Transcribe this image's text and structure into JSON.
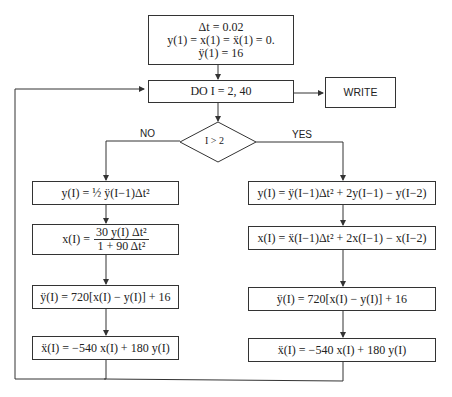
{
  "init": {
    "line1": "Δt = 0.02",
    "line2": "y(1) = x(1) = ẍ(1) = 0.",
    "line3": "ÿ(1) = 16"
  },
  "loop": {
    "label": "DO  I = 2, 40"
  },
  "write": {
    "label": "WRITE"
  },
  "decision": {
    "label": "I > 2",
    "no_label": "NO",
    "yes_label": "YES"
  },
  "no_branch": {
    "step1": "y(I) = ½ ÿ(I−1)Δt²",
    "step2_lhs": "x(I) =",
    "step2_num": "30 y(I) Δt²",
    "step2_den": "1 + 90 Δt²",
    "step3": "ÿ(I) = 720[x(I) − y(I)] + 16",
    "step4": "ẍ(I) = −540 x(I) + 180 y(I)"
  },
  "yes_branch": {
    "step1": "y(I) = ÿ(I−1)Δt² + 2y(I−1) − y(I−2)",
    "step2": "x(I) = ẍ(I−1)Δt² + 2x(I−1) − x(I−2)",
    "step3": "ÿ(I) = 720[x(I) − y(I)] + 16",
    "step4": "ẍ(I) = −540 x(I) + 180 y(I)"
  }
}
